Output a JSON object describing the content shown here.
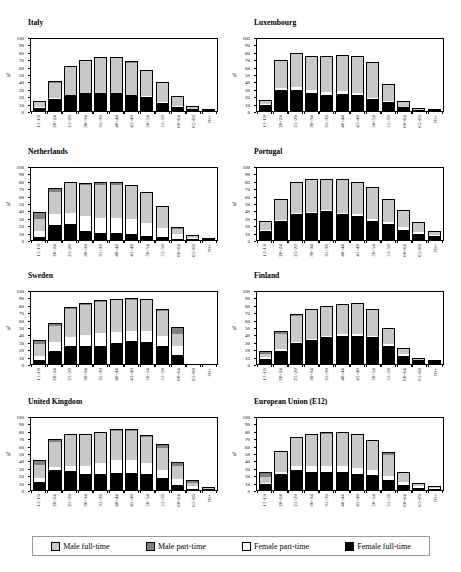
{
  "figure": {
    "y_axis_label": "%",
    "y_ticks": [
      0,
      10,
      20,
      30,
      40,
      50,
      60,
      70,
      80,
      90,
      100
    ],
    "categories": [
      "15-19",
      "20-24",
      "25-29",
      "30-34",
      "35-39",
      "40-44",
      "45-49",
      "50-54",
      "55-59",
      "60-64",
      "65-69",
      "70+"
    ]
  },
  "legend": {
    "items": [
      {
        "key": "male_full_time",
        "label": "Male full-time",
        "color": "#c8c8c8",
        "swatch": "sw-mf"
      },
      {
        "key": "male_part_time",
        "label": "Male part-time",
        "color": "#808080",
        "swatch": "sw-mp"
      },
      {
        "key": "female_part_time",
        "label": "Female part-time",
        "color": "#ffffff",
        "swatch": "sw-fp"
      },
      {
        "key": "female_full_time",
        "label": "Female full-time",
        "color": "#000000",
        "swatch": "sw-ff"
      }
    ]
  },
  "chart_data": [
    {
      "type": "bar",
      "title": "Italy",
      "xlabel": "",
      "ylabel": "%",
      "ylim": [
        0,
        100
      ],
      "stacked": true,
      "grid": false,
      "categories": [
        "15-19",
        "20-24",
        "25-29",
        "30-34",
        "35-39",
        "40-44",
        "45-49",
        "50-54",
        "55-59",
        "60-64",
        "65-69",
        "70+"
      ],
      "series": [
        {
          "name": "Female full-time",
          "color": "#000000",
          "values": [
            4,
            16,
            21,
            24,
            24,
            24,
            21,
            19,
            11,
            6,
            3,
            1
          ]
        },
        {
          "name": "Female part-time",
          "color": "#ffffff",
          "values": [
            1,
            1,
            1,
            1,
            1,
            1,
            1,
            1,
            1,
            1,
            0,
            0
          ]
        },
        {
          "name": "Male full-time",
          "color": "#c8c8c8",
          "values": [
            7,
            21,
            38,
            42,
            46,
            46,
            43,
            34,
            26,
            12,
            4,
            1
          ]
        },
        {
          "name": "Male part-time",
          "color": "#808080",
          "values": [
            1,
            2,
            1,
            2,
            2,
            2,
            2,
            2,
            1,
            1,
            0,
            0
          ]
        }
      ],
      "totals": [
        13,
        40,
        61,
        69,
        73,
        73,
        67,
        56,
        39,
        20,
        7,
        2
      ]
    },
    {
      "type": "bar",
      "title": "Luxembourg",
      "xlabel": "",
      "ylabel": "%",
      "ylim": [
        0,
        100
      ],
      "stacked": true,
      "grid": false,
      "categories": [
        "15-19",
        "20-24",
        "25-29",
        "30-34",
        "35-39",
        "40-44",
        "45-49",
        "50-54",
        "55-59",
        "60-64",
        "65-69",
        "70+"
      ],
      "series": [
        {
          "name": "Female full-time",
          "color": "#000000",
          "values": [
            8,
            29,
            29,
            25,
            22,
            23,
            22,
            16,
            12,
            5,
            2,
            1
          ]
        },
        {
          "name": "Female part-time",
          "color": "#ffffff",
          "values": [
            1,
            2,
            4,
            4,
            4,
            4,
            3,
            2,
            1,
            1,
            0,
            0
          ]
        },
        {
          "name": "Male full-time",
          "color": "#c8c8c8",
          "values": [
            6,
            37,
            45,
            44,
            48,
            48,
            48,
            47,
            23,
            7,
            2,
            0
          ]
        },
        {
          "name": "Male part-time",
          "color": "#808080",
          "values": [
            0,
            1,
            1,
            1,
            1,
            1,
            1,
            1,
            1,
            1,
            0,
            0
          ]
        }
      ],
      "totals": [
        15,
        69,
        79,
        74,
        75,
        76,
        74,
        66,
        37,
        14,
        4,
        1
      ]
    },
    {
      "type": "bar",
      "title": "Netherlands",
      "xlabel": "",
      "ylabel": "%",
      "ylim": [
        0,
        100
      ],
      "stacked": true,
      "grid": false,
      "categories": [
        "15-19",
        "20-24",
        "25-29",
        "30-34",
        "35-39",
        "40-44",
        "45-49",
        "50-54",
        "55-59",
        "60-64",
        "65-69",
        "70+"
      ],
      "series": [
        {
          "name": "Female full-time",
          "color": "#000000",
          "values": [
            4,
            20,
            21,
            12,
            9,
            9,
            8,
            5,
            4,
            2,
            1,
            0
          ]
        },
        {
          "name": "Female part-time",
          "color": "#ffffff",
          "values": [
            8,
            15,
            15,
            20,
            21,
            21,
            21,
            18,
            12,
            6,
            2,
            1
          ]
        },
        {
          "name": "Male full-time",
          "color": "#c8c8c8",
          "values": [
            17,
            30,
            41,
            43,
            45,
            45,
            44,
            40,
            28,
            7,
            3,
            1
          ]
        },
        {
          "name": "Male part-time",
          "color": "#808080",
          "values": [
            9,
            5,
            2,
            2,
            3,
            3,
            2,
            2,
            2,
            2,
            1,
            0
          ]
        }
      ],
      "totals": [
        38,
        70,
        79,
        77,
        78,
        78,
        75,
        65,
        46,
        17,
        7,
        2
      ]
    },
    {
      "type": "bar",
      "title": "Portugal",
      "xlabel": "",
      "ylabel": "%",
      "ylim": [
        0,
        100
      ],
      "stacked": true,
      "grid": false,
      "categories": [
        "15-19",
        "20-24",
        "25-29",
        "30-34",
        "35-39",
        "40-44",
        "45-49",
        "50-54",
        "55-59",
        "60-64",
        "65-69",
        "70+"
      ],
      "series": [
        {
          "name": "Female full-time",
          "color": "#000000",
          "values": [
            12,
            26,
            35,
            36,
            39,
            35,
            33,
            26,
            21,
            13,
            8,
            6
          ]
        },
        {
          "name": "Female part-time",
          "color": "#ffffff",
          "values": [
            1,
            1,
            1,
            2,
            1,
            2,
            2,
            3,
            3,
            4,
            3,
            1
          ]
        },
        {
          "name": "Male full-time",
          "color": "#c8c8c8",
          "values": [
            11,
            28,
            41,
            43,
            42,
            44,
            43,
            41,
            30,
            22,
            12,
            5
          ]
        },
        {
          "name": "Male part-time",
          "color": "#808080",
          "values": [
            2,
            1,
            1,
            1,
            1,
            1,
            1,
            1,
            1,
            1,
            1,
            0
          ]
        }
      ],
      "totals": [
        26,
        56,
        78,
        82,
        83,
        82,
        79,
        71,
        55,
        40,
        24,
        12
      ]
    },
    {
      "type": "bar",
      "title": "Sweden",
      "xlabel": "",
      "ylabel": "%",
      "ylim": [
        0,
        100
      ],
      "stacked": true,
      "grid": false,
      "categories": [
        "15-19",
        "20-24",
        "25-29",
        "30-34",
        "35-39",
        "40-44",
        "45-49",
        "50-54",
        "55-59",
        "60-64",
        "65-69",
        "70+"
      ],
      "series": [
        {
          "name": "Female full-time",
          "color": "#000000",
          "values": [
            6,
            17,
            25,
            25,
            25,
            29,
            31,
            30,
            24,
            12,
            0,
            0
          ]
        },
        {
          "name": "Female part-time",
          "color": "#ffffff",
          "values": [
            5,
            13,
            12,
            14,
            17,
            14,
            13,
            14,
            14,
            12,
            0,
            0
          ]
        },
        {
          "name": "Male full-time",
          "color": "#c8c8c8",
          "values": [
            16,
            21,
            37,
            41,
            42,
            43,
            43,
            42,
            33,
            17,
            0,
            0
          ]
        },
        {
          "name": "Male part-time",
          "color": "#808080",
          "values": [
            5,
            5,
            3,
            3,
            3,
            2,
            2,
            2,
            3,
            9,
            0,
            0
          ]
        }
      ],
      "totals": [
        32,
        56,
        77,
        83,
        87,
        88,
        89,
        88,
        74,
        50,
        0,
        0
      ]
    },
    {
      "type": "bar",
      "title": "Finland",
      "xlabel": "",
      "ylabel": "%",
      "ylim": [
        0,
        100
      ],
      "stacked": true,
      "grid": false,
      "categories": [
        "15-19",
        "20-24",
        "25-29",
        "30-34",
        "35-39",
        "40-44",
        "45-49",
        "50-54",
        "55-59",
        "60-64",
        "65-69",
        "70+"
      ],
      "series": [
        {
          "name": "Female full-time",
          "color": "#000000",
          "values": [
            7,
            17,
            28,
            32,
            36,
            38,
            38,
            36,
            24,
            11,
            5,
            4
          ]
        },
        {
          "name": "Female part-time",
          "color": "#ffffff",
          "values": [
            3,
            3,
            2,
            2,
            2,
            2,
            2,
            2,
            3,
            3,
            1,
            0
          ]
        },
        {
          "name": "Male full-time",
          "color": "#c8c8c8",
          "values": [
            4,
            20,
            35,
            40,
            40,
            40,
            41,
            36,
            20,
            6,
            2,
            1
          ]
        },
        {
          "name": "Male part-time",
          "color": "#808080",
          "values": [
            3,
            4,
            2,
            1,
            1,
            1,
            1,
            1,
            2,
            1,
            0,
            0
          ]
        }
      ],
      "totals": [
        17,
        44,
        67,
        75,
        79,
        81,
        82,
        75,
        49,
        21,
        8,
        5
      ]
    },
    {
      "type": "bar",
      "title": "United Kingdom",
      "xlabel": "",
      "ylabel": "%",
      "ylim": [
        0,
        100
      ],
      "stacked": true,
      "grid": false,
      "categories": [
        "15-19",
        "20-24",
        "25-29",
        "30-34",
        "35-39",
        "40-44",
        "45-49",
        "50-54",
        "55-59",
        "60-64",
        "65-69",
        "70+"
      ],
      "series": [
        {
          "name": "Female full-time",
          "color": "#000000",
          "values": [
            11,
            27,
            26,
            21,
            21,
            23,
            23,
            21,
            16,
            7,
            2,
            1
          ]
        },
        {
          "name": "Female part-time",
          "color": "#ffffff",
          "values": [
            5,
            4,
            7,
            12,
            16,
            17,
            17,
            15,
            11,
            8,
            3,
            1
          ]
        },
        {
          "name": "Male full-time",
          "color": "#c8c8c8",
          "values": [
            18,
            34,
            41,
            41,
            40,
            40,
            40,
            36,
            30,
            18,
            5,
            1
          ]
        },
        {
          "name": "Male part-time",
          "color": "#808080",
          "values": [
            7,
            4,
            2,
            2,
            2,
            2,
            2,
            2,
            5,
            5,
            3,
            1
          ]
        }
      ],
      "totals": [
        41,
        69,
        76,
        76,
        79,
        82,
        82,
        74,
        62,
        38,
        13,
        4
      ]
    },
    {
      "type": "bar",
      "title": "European Union (E12)",
      "xlabel": "",
      "ylabel": "%",
      "ylim": [
        0,
        100
      ],
      "stacked": true,
      "grid": false,
      "categories": [
        "15-19",
        "20-24",
        "25-29",
        "30-34",
        "35-39",
        "40-44",
        "45-49",
        "50-54",
        "55-59",
        "60-64",
        "65-69",
        "70+"
      ],
      "series": [
        {
          "name": "Female full-time",
          "color": "#000000",
          "values": [
            8,
            21,
            27,
            25,
            24,
            24,
            22,
            20,
            14,
            7,
            3,
            2
          ]
        },
        {
          "name": "Female part-time",
          "color": "#ffffff",
          "values": [
            2,
            3,
            5,
            7,
            8,
            8,
            8,
            7,
            5,
            4,
            2,
            1
          ]
        },
        {
          "name": "Male full-time",
          "color": "#c8c8c8",
          "values": [
            8,
            27,
            38,
            42,
            44,
            45,
            44,
            39,
            29,
            12,
            4,
            2
          ]
        },
        {
          "name": "Male part-time",
          "color": "#808080",
          "values": [
            6,
            2,
            2,
            2,
            2,
            2,
            2,
            2,
            3,
            2,
            1,
            1
          ]
        }
      ],
      "totals": [
        24,
        53,
        72,
        76,
        78,
        79,
        76,
        68,
        51,
        25,
        10,
        6
      ]
    }
  ]
}
